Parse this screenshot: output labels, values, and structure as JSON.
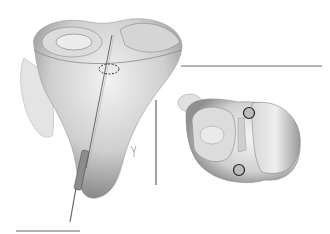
{
  "figure": {
    "panels": [
      {
        "name": "tibia-anterior-view",
        "marker": "dashed-ellipse",
        "instrument": "guide-wire"
      },
      {
        "name": "tibial-plateau-top-view",
        "markers": [
          "circle-posterior",
          "circle-anterior"
        ]
      }
    ],
    "colors": {
      "background": "#ffffff",
      "line": "#555555",
      "bone_light": "#e8e8e8",
      "bone_mid": "#bdbdbd",
      "bone_dark": "#7a7a7a"
    }
  }
}
